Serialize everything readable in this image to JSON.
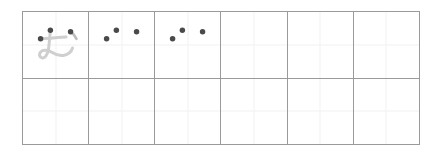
{
  "worksheet": {
    "type": "hiragana-handwriting-practice",
    "character": "ぢ",
    "romaji": "di",
    "grid": {
      "columns": 6,
      "rows": 2,
      "border_color": "#9a9a9a",
      "guide_line_color": "#f2f2f2",
      "background_color": "#ffffff"
    },
    "trace_color": "#cfcfcf",
    "dot_color": "#4a4a4a",
    "cells": [
      {
        "index": 0,
        "row": 0,
        "column": 0,
        "name": "cell-r1c1",
        "has_trace_character": true,
        "trace_character": "ぢ",
        "dot_count": 3,
        "dots": [
          {
            "name": "stroke-start-dot-1",
            "x": 42,
            "y": 28
          },
          {
            "name": "stroke-start-dot-2",
            "x": 27,
            "y": 41
          },
          {
            "name": "stroke-start-dot-3",
            "x": 73,
            "y": 30
          }
        ]
      },
      {
        "index": 1,
        "row": 0,
        "column": 1,
        "name": "cell-r1c2",
        "has_trace_character": false,
        "trace_character": "",
        "dot_count": 3,
        "dots": [
          {
            "name": "stroke-start-dot-1",
            "x": 42,
            "y": 28
          },
          {
            "name": "stroke-start-dot-2",
            "x": 27,
            "y": 41
          },
          {
            "name": "stroke-start-dot-3",
            "x": 73,
            "y": 30
          }
        ]
      },
      {
        "index": 2,
        "row": 0,
        "column": 2,
        "name": "cell-r1c3",
        "has_trace_character": false,
        "trace_character": "",
        "dot_count": 3,
        "dots": [
          {
            "name": "stroke-start-dot-1",
            "x": 42,
            "y": 28
          },
          {
            "name": "stroke-start-dot-2",
            "x": 27,
            "y": 41
          },
          {
            "name": "stroke-start-dot-3",
            "x": 73,
            "y": 30
          }
        ]
      },
      {
        "index": 3,
        "row": 0,
        "column": 3,
        "name": "cell-r1c4",
        "has_trace_character": false,
        "trace_character": "",
        "dot_count": 0,
        "dots": []
      },
      {
        "index": 4,
        "row": 0,
        "column": 4,
        "name": "cell-r1c5",
        "has_trace_character": false,
        "trace_character": "",
        "dot_count": 0,
        "dots": []
      },
      {
        "index": 5,
        "row": 0,
        "column": 5,
        "name": "cell-r1c6",
        "has_trace_character": false,
        "trace_character": "",
        "dot_count": 0,
        "dots": []
      },
      {
        "index": 6,
        "row": 1,
        "column": 0,
        "name": "cell-r2c1",
        "has_trace_character": false,
        "trace_character": "",
        "dot_count": 0,
        "dots": []
      },
      {
        "index": 7,
        "row": 1,
        "column": 1,
        "name": "cell-r2c2",
        "has_trace_character": false,
        "trace_character": "",
        "dot_count": 0,
        "dots": []
      },
      {
        "index": 8,
        "row": 1,
        "column": 2,
        "name": "cell-r2c3",
        "has_trace_character": false,
        "trace_character": "",
        "dot_count": 0,
        "dots": []
      },
      {
        "index": 9,
        "row": 1,
        "column": 3,
        "name": "cell-r2c4",
        "has_trace_character": false,
        "trace_character": "",
        "dot_count": 0,
        "dots": []
      },
      {
        "index": 10,
        "row": 1,
        "column": 4,
        "name": "cell-r2c5",
        "has_trace_character": false,
        "trace_character": "",
        "dot_count": 0,
        "dots": []
      },
      {
        "index": 11,
        "row": 1,
        "column": 5,
        "name": "cell-r2c6",
        "has_trace_character": false,
        "trace_character": "",
        "dot_count": 0,
        "dots": []
      }
    ]
  }
}
